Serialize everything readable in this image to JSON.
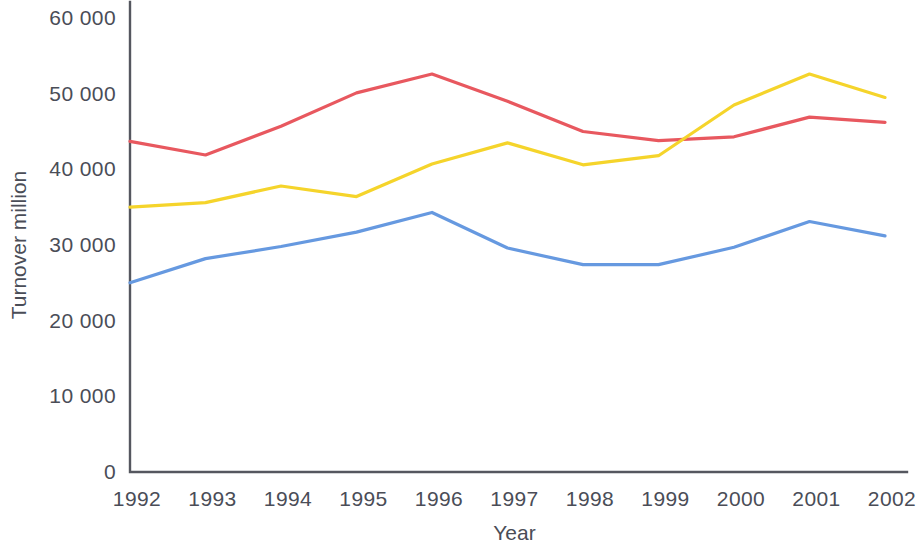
{
  "chart_data": {
    "type": "line",
    "title": "",
    "subtitle": "",
    "xlabel": "Year",
    "ylabel": "Turnover million",
    "x": [
      1992,
      1993,
      1994,
      1995,
      1996,
      1997,
      1998,
      1999,
      2000,
      2001,
      2002
    ],
    "x_tick_labels": [
      "1992",
      "1993",
      "1994",
      "1995",
      "1996",
      "1997",
      "1998",
      "1999",
      "2000",
      "2001",
      "2002"
    ],
    "y_tick_labels": [
      "0",
      "10 000",
      "20 000",
      "30 000",
      "40 000",
      "50 000",
      "60 000"
    ],
    "y_tick_values": [
      0,
      10000,
      20000,
      30000,
      40000,
      50000,
      60000
    ],
    "xlim": [
      1992,
      2002
    ],
    "ylim": [
      0,
      60000
    ],
    "grid": false,
    "legend": "none",
    "series": [
      {
        "name": "series-red",
        "color": "#e8585f",
        "values": [
          43700,
          41900,
          45700,
          50100,
          52600,
          49000,
          45000,
          43800,
          44300,
          46900,
          46200
        ]
      },
      {
        "name": "series-yellow",
        "color": "#f5d42b",
        "values": [
          35000,
          35600,
          37800,
          36400,
          40700,
          43500,
          40600,
          41800,
          48500,
          52600,
          49500
        ]
      },
      {
        "name": "series-blue",
        "color": "#6699e0",
        "values": [
          25000,
          28200,
          29800,
          31700,
          34300,
          29600,
          27400,
          27400,
          29700,
          33100,
          31200
        ]
      }
    ],
    "axis_color": "#55575f",
    "background_color": "#ffffff",
    "text_color": "#4a4d57"
  }
}
